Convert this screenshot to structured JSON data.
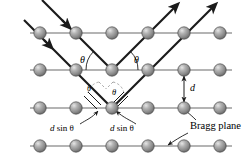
{
  "figure": {
    "colors": {
      "atom_fill": "#8c8c8c",
      "atom_highlight": "#d8d8d8",
      "atom_edge": "#4a4a4a",
      "ray": "#1a1a1a",
      "plane_line": "#6b6b6b",
      "dash": "#9a9a9a",
      "text": "#000000",
      "background": "#ffffff"
    },
    "labels": {
      "theta_incident": "θ",
      "theta_reflected": "θ",
      "theta_lower_left": "θ",
      "theta_lower_right": "θ",
      "spacing": "d",
      "path_left": "d sin θ",
      "path_right": "d sin θ",
      "bragg_plane": "Bragg plane"
    },
    "path_left_italic": "d",
    "path_left_rest": " sin θ",
    "path_right_italic": "d",
    "path_right_rest": " sin θ",
    "rows": [
      {
        "name": "row-1",
        "y": 33,
        "atoms": 6
      },
      {
        "name": "row-2",
        "y": 70,
        "atoms": 6
      },
      {
        "name": "row-3",
        "y": 108,
        "atoms": 6
      },
      {
        "name": "row-4",
        "y": 146,
        "atoms": 6
      }
    ],
    "atom_x": [
      40,
      76,
      112,
      148,
      184,
      220
    ],
    "atom_radius": 6.2,
    "geometry": {
      "incident_ray_count": 2,
      "reflected_ray_count": 2,
      "incident_angle_deg": 45,
      "scatter_atom_row2_x": 112,
      "scatter_atom_row3_x": 112
    }
  }
}
